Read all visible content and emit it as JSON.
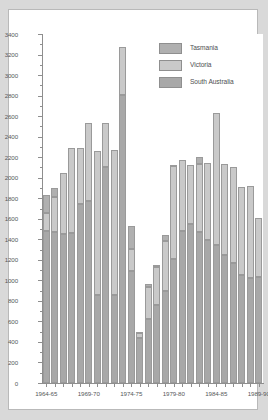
{
  "chart_data": {
    "type": "bar",
    "stacked": true,
    "title": "",
    "xlabel": "",
    "ylabel": "",
    "ylim": [
      0,
      3400
    ],
    "ytick_step": 200,
    "ytick_labels": [
      "0",
      "200",
      "400",
      "600",
      "800",
      "1000",
      "1200",
      "1400",
      "1600",
      "1800",
      "2000",
      "2200",
      "2400",
      "2600",
      "2800",
      "3000",
      "3200",
      "3400"
    ],
    "grid": false,
    "legend_position": "top-right",
    "categories": [
      "1964-65",
      "1965-66",
      "1966-67",
      "1967-68",
      "1968-69",
      "1969-70",
      "1970-71",
      "1971-72",
      "1972-73",
      "1973-74",
      "1974-75",
      "1975-76",
      "1976-77",
      "1977-78",
      "1978-79",
      "1979-80",
      "1980-81",
      "1981-82",
      "1982-83",
      "1983-84",
      "1984-85",
      "1985-86",
      "1986-87",
      "1987-88",
      "1988-89",
      "1989-90"
    ],
    "xtick_labels": [
      "1964-65",
      "1969-70",
      "1974-75",
      "1979-80",
      "1984-85",
      "1989-90"
    ],
    "xtick_indices": [
      0,
      5,
      10,
      15,
      20,
      25
    ],
    "series": [
      {
        "name": "South Australia",
        "color": "#a8a8a8",
        "values": [
          1480,
          1470,
          1450,
          1460,
          1740,
          1770,
          860,
          2100,
          860,
          2810,
          1090,
          440,
          620,
          760,
          900,
          1210,
          1480,
          1550,
          1470,
          1390,
          1340,
          1250,
          1170,
          1050,
          1020,
          1030
        ]
      },
      {
        "name": "Victoria",
        "color": "#c9c9c9",
        "values": [
          180,
          340,
          600,
          830,
          550,
          760,
          1400,
          430,
          1410,
          460,
          220,
          50,
          320,
          370,
          480,
          900,
          690,
          570,
          660,
          750,
          1290,
          880,
          930,
          860,
          900,
          580
        ]
      },
      {
        "name": "Tasmania",
        "color": "#b0b0b0",
        "values": [
          170,
          90,
          0,
          0,
          0,
          0,
          0,
          0,
          0,
          0,
          220,
          10,
          20,
          20,
          60,
          10,
          0,
          0,
          70,
          0,
          0,
          0,
          0,
          0,
          0,
          0
        ]
      }
    ],
    "totals": [
      1830,
      1900,
      2050,
      2290,
      2290,
      2530,
      2260,
      2530,
      2270,
      3270,
      1530,
      500,
      960,
      1150,
      1440,
      2120,
      2170,
      2120,
      2200,
      2140,
      2630,
      2130,
      2100,
      1910,
      1920,
      1610
    ]
  },
  "legend": {
    "items": [
      {
        "label": "Tasmania"
      },
      {
        "label": "Victoria"
      },
      {
        "label": "South Australia"
      }
    ]
  }
}
